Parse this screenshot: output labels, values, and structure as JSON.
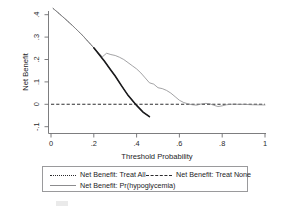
{
  "chart_data": {
    "type": "line",
    "title": "",
    "xlabel": "Threshold Probability",
    "ylabel": "Net Benefit",
    "xlim": [
      0,
      1
    ],
    "ylim": [
      -0.1,
      0.45
    ],
    "grid": false,
    "legend_position": "below-axes",
    "xticks": [
      "0",
      ".2",
      ".4",
      ".6",
      ".8",
      "1"
    ],
    "xtick_values": [
      0,
      0.2,
      0.4,
      0.6,
      0.8,
      1
    ],
    "yticks": [
      "-.1",
      "0",
      ".1",
      ".2",
      ".3",
      ".4"
    ],
    "ytick_values": [
      -0.1,
      0,
      0.1,
      0.2,
      0.3,
      0.4
    ],
    "series": [
      {
        "name": "Net Benefit: Treat All",
        "style": "dotted",
        "color": "#3b3b3d",
        "x": [
          0.01,
          0.05,
          0.1,
          0.15,
          0.2,
          0.25,
          0.28,
          0.3,
          0.33,
          0.36,
          0.4,
          0.43,
          0.46
        ],
        "values": [
          0.428,
          0.395,
          0.352,
          0.305,
          0.252,
          0.192,
          0.152,
          0.126,
          0.082,
          0.04,
          -0.005,
          -0.035,
          -0.055
        ]
      },
      {
        "name": "Net Benefit: Treat None",
        "style": "dashed",
        "color": "#2f2f31",
        "x": [
          0,
          1
        ],
        "values": [
          0,
          0
        ]
      },
      {
        "name": "Net Benefit: Pr(hypoglycemia)",
        "style": "solid",
        "color": "#8c8c8e",
        "x": [
          0.01,
          0.05,
          0.1,
          0.15,
          0.2,
          0.24,
          0.26,
          0.28,
          0.3,
          0.32,
          0.34,
          0.36,
          0.38,
          0.4,
          0.42,
          0.44,
          0.46,
          0.48,
          0.5,
          0.52,
          0.54,
          0.56,
          0.58,
          0.6,
          0.62,
          0.64,
          0.66,
          0.68,
          0.7,
          0.72,
          0.74,
          0.76,
          0.78,
          0.8,
          0.82,
          0.84,
          0.86,
          0.88,
          0.9,
          0.94,
          1.0
        ],
        "values": [
          0.428,
          0.395,
          0.352,
          0.305,
          0.252,
          0.212,
          0.228,
          0.222,
          0.218,
          0.21,
          0.2,
          0.186,
          0.172,
          0.158,
          0.14,
          0.118,
          0.096,
          0.09,
          0.074,
          0.07,
          0.062,
          0.05,
          0.034,
          0.018,
          0.008,
          0.002,
          -0.002,
          -0.004,
          0.001,
          0.004,
          0.003,
          -0.004,
          -0.01,
          -0.007,
          -0.002,
          0.0,
          0.001,
          -0.001,
          0.0,
          -0.002,
          -0.003
        ]
      }
    ]
  },
  "axes": {
    "ylabel": "Net Benefit",
    "xlabel": "Threshold Probability",
    "xticklabels": [
      "0",
      ".2",
      ".4",
      ".6",
      ".8",
      "1"
    ],
    "yticklabels": [
      ".4",
      ".3",
      ".2",
      ".1",
      "0",
      "-.1"
    ]
  },
  "legend": {
    "entries": [
      {
        "key": "dotted",
        "label": "Net Benefit: Treat All"
      },
      {
        "key": "dashed",
        "label": "Net Benefit: Treat None"
      },
      {
        "key": "solid",
        "label": "Net Benefit: Pr(hypoglycemia)"
      }
    ]
  },
  "caption": {
    "text": ""
  },
  "colors": {
    "treat_all": "#3b3b3d",
    "treat_none": "#2f2f31",
    "model": "#8c8c8e",
    "axis": "#6e6e70",
    "background": "#ffffff"
  }
}
